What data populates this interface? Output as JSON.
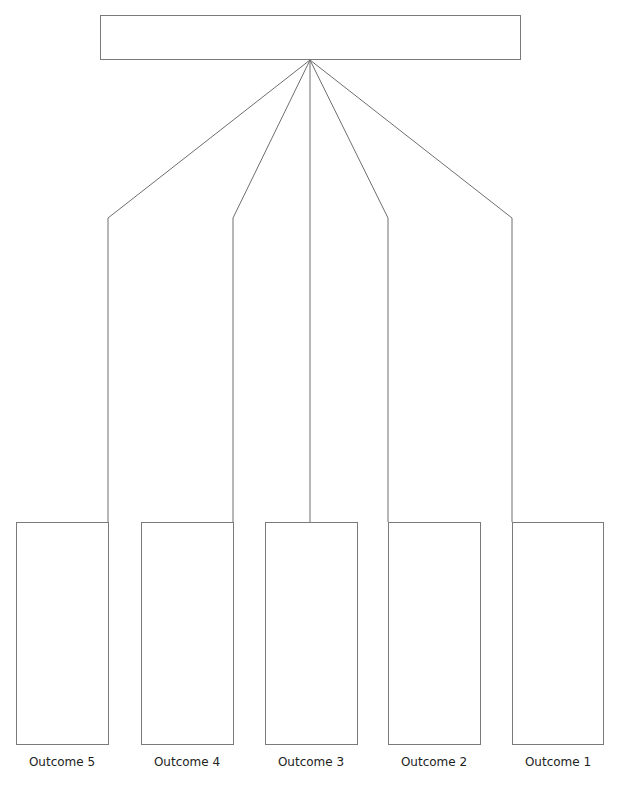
{
  "diagram": {
    "type": "tree",
    "top_box": {
      "text": ""
    },
    "outcomes": [
      {
        "label": "Outcome 5",
        "text": ""
      },
      {
        "label": "Outcome 4",
        "text": ""
      },
      {
        "label": "Outcome 3",
        "text": ""
      },
      {
        "label": "Outcome 2",
        "text": ""
      },
      {
        "label": "Outcome 1",
        "text": ""
      }
    ],
    "line_color": "#7a7a7a"
  }
}
